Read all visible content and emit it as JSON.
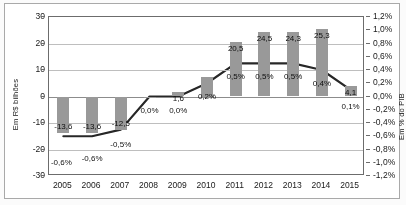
{
  "chart_data": {
    "type": "bar",
    "title": "",
    "subtitle": "",
    "categories": [
      "2005",
      "2006",
      "2007",
      "2008",
      "2009",
      "2010",
      "2011",
      "2012",
      "2013",
      "2014",
      "2015"
    ],
    "xlabel": "",
    "ylabel": "Em R$ bilhões",
    "y2label": "Em % do PIB",
    "ylim": [
      -30,
      30
    ],
    "y2lim": [
      -1.2,
      1.2
    ],
    "grid": true,
    "legend": "none",
    "y_ticks": [
      "30",
      "20",
      "10",
      "0",
      "-10",
      "-20",
      "-30"
    ],
    "y_tick_values": [
      30,
      20,
      10,
      0,
      -10,
      -20,
      -30
    ],
    "y2_ticks": [
      "1,2%",
      "1,0%",
      "0,8%",
      "0,6%",
      "0,4%",
      "0,2%",
      "0,0%",
      "-0,2%",
      "-0,4%",
      "-0,6%",
      "-0,8%",
      "-1,0%",
      "-1,2%"
    ],
    "y2_tick_values": [
      1.2,
      1.0,
      0.8,
      0.6,
      0.4,
      0.2,
      0.0,
      -0.2,
      -0.4,
      -0.6,
      -0.8,
      -1.0,
      -1.2
    ],
    "series": [
      {
        "name": "Em R$ bilhões",
        "type": "bar",
        "axis": "left",
        "color": "#9a9894",
        "values": [
          -13.6,
          -13.6,
          -12.5,
          0.0,
          1.6,
          7.5,
          20.5,
          24.5,
          24.3,
          25.3,
          4.1
        ],
        "labels": [
          "-13,6",
          "-13,6",
          "-12,5",
          "",
          "1,6",
          "",
          "20,5",
          "24,5",
          "24,3",
          "25,3",
          "4,1"
        ]
      },
      {
        "name": "Em % do PIB",
        "type": "line",
        "axis": "right",
        "color": "#2b2a28",
        "values": [
          -0.6,
          -0.6,
          -0.5,
          0.0,
          0.0,
          0.2,
          0.5,
          0.5,
          0.5,
          0.4,
          0.1
        ],
        "labels": [
          "-0,6%",
          "-0,6%",
          "-0,5%",
          "0,0%",
          "0,0%",
          "0,2%",
          "0,5%",
          "0,5%",
          "0,5%",
          "0,4%",
          "0,1%"
        ]
      }
    ]
  }
}
